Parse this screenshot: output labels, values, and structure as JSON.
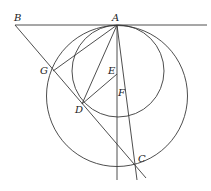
{
  "figure": {
    "type": "geometry-diagram",
    "labels": {
      "A": "A",
      "B": "B",
      "C": "C",
      "D": "D",
      "E": "E",
      "F": "F",
      "G": "G"
    },
    "points": {
      "A": [
        117,
        25
      ],
      "B": [
        15,
        25
      ],
      "C": [
        136,
        165
      ],
      "D": [
        82,
        104
      ],
      "E": [
        117,
        74
      ],
      "G": [
        53,
        71
      ]
    },
    "circles": [
      {
        "name": "small-circle",
        "center": [
          118,
          71
        ],
        "radius": 46
      },
      {
        "name": "large-circle",
        "center": [
          117,
          96
        ],
        "radius": 70
      }
    ],
    "colors": {
      "stroke": "#3a3a3a",
      "text": "#222222"
    }
  }
}
